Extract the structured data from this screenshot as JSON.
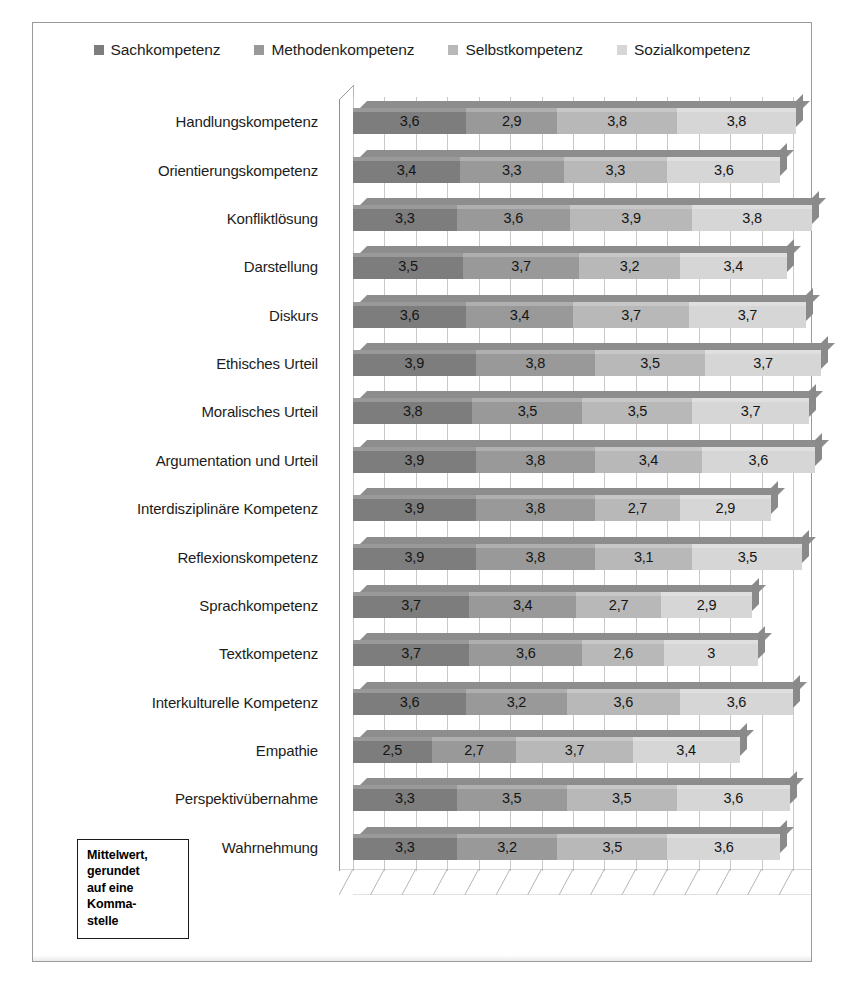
{
  "figure": {
    "note_box": {
      "lines": [
        "Mittelwert,",
        "gerundet",
        "auf eine",
        "Komma-",
        "stelle"
      ]
    }
  },
  "chart_data": {
    "type": "bar",
    "orientation": "horizontal",
    "stacked": true,
    "title": "",
    "xlabel": "",
    "ylabel": "",
    "grid": true,
    "legend_position": "top",
    "xlim": [
      0,
      14
    ],
    "gridline_count": 14,
    "value_decimal_separator": ",",
    "categories": [
      "Handlungskompetenz",
      "Orientierungskompetenz",
      "Konfliktlösung",
      "Darstellung",
      "Diskurs",
      "Ethisches Urteil",
      "Moralisches Urteil",
      "Argumentation und Urteil",
      "Interdisziplinäre Kompetenz",
      "Reflexionskompetenz",
      "Sprachkompetenz",
      "Textkompetenz",
      "Interkulturelle Kompetenz",
      "Empathie",
      "Perspektivübernahme",
      "Wahrnehmung"
    ],
    "series": [
      {
        "name": "Sachkompetenz",
        "color": "#7d7d7d",
        "values": [
          3.6,
          3.4,
          3.3,
          3.5,
          3.6,
          3.9,
          3.8,
          3.9,
          3.9,
          3.9,
          3.7,
          3.7,
          3.6,
          2.5,
          3.3,
          3.3
        ],
        "labels": [
          "3,6",
          "3,4",
          "3,3",
          "3,5",
          "3,6",
          "3,9",
          "3,8",
          "3,9",
          "3,9",
          "3,9",
          "3,7",
          "3,7",
          "3,6",
          "2,5",
          "3,3",
          "3,3"
        ]
      },
      {
        "name": "Methodenkompetenz",
        "color": "#999999",
        "values": [
          2.9,
          3.3,
          3.6,
          3.7,
          3.4,
          3.8,
          3.5,
          3.8,
          3.8,
          3.8,
          3.4,
          3.6,
          3.2,
          2.7,
          3.5,
          3.2
        ],
        "labels": [
          "2,9",
          "3,3",
          "3,6",
          "3,7",
          "3,4",
          "3,8",
          "3,5",
          "3,8",
          "3,8",
          "3,8",
          "3,4",
          "3,6",
          "3,2",
          "2,7",
          "3,5",
          "3,2"
        ]
      },
      {
        "name": "Selbstkompetenz",
        "color": "#b8b8b8",
        "values": [
          3.8,
          3.3,
          3.9,
          3.2,
          3.7,
          3.5,
          3.5,
          3.4,
          2.7,
          3.1,
          2.7,
          2.6,
          3.6,
          3.7,
          3.5,
          3.5
        ],
        "labels": [
          "3,8",
          "3,3",
          "3,9",
          "3,2",
          "3,7",
          "3,5",
          "3,5",
          "3,4",
          "2,7",
          "3,1",
          "2,7",
          "2,6",
          "3,6",
          "3,7",
          "3,5",
          "3,5"
        ]
      },
      {
        "name": "Sozialkompetenz",
        "color": "#d6d6d6",
        "values": [
          3.8,
          3.6,
          3.8,
          3.4,
          3.7,
          3.7,
          3.7,
          3.6,
          2.9,
          3.5,
          2.9,
          3.0,
          3.6,
          3.4,
          3.6,
          3.6
        ],
        "labels": [
          "3,8",
          "3,6",
          "3,8",
          "3,4",
          "3,7",
          "3,7",
          "3,7",
          "3,6",
          "2,9",
          "3,5",
          "2,9",
          "3",
          "3,6",
          "3,4",
          "3,6",
          "3,6"
        ]
      }
    ]
  }
}
